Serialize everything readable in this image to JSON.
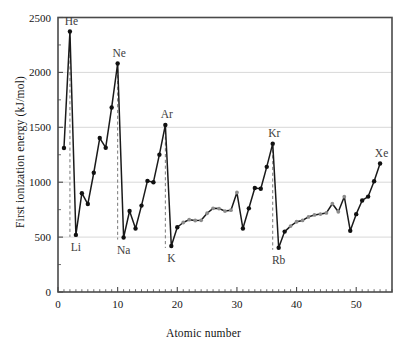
{
  "chart_data": {
    "type": "line",
    "title": "",
    "xlabel": "Atomic number",
    "ylabel": "First ionization energy (kJ/mol)",
    "xlim": [
      0,
      56
    ],
    "ylim": [
      0,
      2500
    ],
    "xticks": [
      0,
      10,
      20,
      30,
      40,
      50
    ],
    "yticks": [
      0,
      500,
      1000,
      1500,
      2000,
      2500
    ],
    "xticklabels": [
      "0",
      "10",
      "20",
      "30",
      "40",
      "50"
    ],
    "yticklabels": [
      "0",
      "500",
      "1000",
      "1500",
      "2000",
      "2500"
    ],
    "grid": "horizontal-major",
    "legend": "none",
    "x": [
      1,
      2,
      3,
      4,
      5,
      6,
      7,
      8,
      9,
      10,
      11,
      12,
      13,
      14,
      15,
      16,
      17,
      18,
      19,
      20,
      21,
      22,
      23,
      24,
      25,
      26,
      27,
      28,
      29,
      30,
      31,
      32,
      33,
      34,
      35,
      36,
      37,
      38,
      39,
      40,
      41,
      42,
      43,
      44,
      45,
      46,
      47,
      48,
      49,
      50,
      51,
      52,
      53,
      54
    ],
    "values": [
      1312,
      2372,
      520,
      900,
      801,
      1086,
      1402,
      1314,
      1681,
      2081,
      496,
      738,
      578,
      787,
      1012,
      1000,
      1251,
      1521,
      419,
      590,
      633,
      659,
      651,
      653,
      717,
      762,
      760,
      737,
      745,
      906,
      579,
      762,
      947,
      941,
      1140,
      1351,
      403,
      550,
      600,
      640,
      652,
      684,
      702,
      710,
      720,
      804,
      731,
      868,
      558,
      709,
      834,
      869,
      1008,
      1170
    ],
    "series": [
      {
        "name": "First ionization energy",
        "units": "kJ/mol",
        "points": [
          {
            "z": 1,
            "symbol": "H",
            "value": 1312,
            "marker": "filled"
          },
          {
            "z": 2,
            "symbol": "He",
            "value": 2372,
            "marker": "filled"
          },
          {
            "z": 3,
            "symbol": "Li",
            "value": 520,
            "marker": "filled"
          },
          {
            "z": 4,
            "symbol": "Be",
            "value": 900,
            "marker": "filled"
          },
          {
            "z": 5,
            "symbol": "B",
            "value": 801,
            "marker": "filled"
          },
          {
            "z": 6,
            "symbol": "C",
            "value": 1086,
            "marker": "filled"
          },
          {
            "z": 7,
            "symbol": "N",
            "value": 1402,
            "marker": "filled"
          },
          {
            "z": 8,
            "symbol": "O",
            "value": 1314,
            "marker": "filled"
          },
          {
            "z": 9,
            "symbol": "F",
            "value": 1681,
            "marker": "filled"
          },
          {
            "z": 10,
            "symbol": "Ne",
            "value": 2081,
            "marker": "filled"
          },
          {
            "z": 11,
            "symbol": "Na",
            "value": 496,
            "marker": "filled"
          },
          {
            "z": 12,
            "symbol": "Mg",
            "value": 738,
            "marker": "filled"
          },
          {
            "z": 13,
            "symbol": "Al",
            "value": 578,
            "marker": "filled"
          },
          {
            "z": 14,
            "symbol": "Si",
            "value": 787,
            "marker": "filled"
          },
          {
            "z": 15,
            "symbol": "P",
            "value": 1012,
            "marker": "filled"
          },
          {
            "z": 16,
            "symbol": "S",
            "value": 1000,
            "marker": "filled"
          },
          {
            "z": 17,
            "symbol": "Cl",
            "value": 1251,
            "marker": "filled"
          },
          {
            "z": 18,
            "symbol": "Ar",
            "value": 1521,
            "marker": "filled"
          },
          {
            "z": 19,
            "symbol": "K",
            "value": 419,
            "marker": "filled"
          },
          {
            "z": 20,
            "symbol": "Ca",
            "value": 590,
            "marker": "filled"
          },
          {
            "z": 21,
            "symbol": "Sc",
            "value": 633,
            "marker": "grey"
          },
          {
            "z": 22,
            "symbol": "Ti",
            "value": 659,
            "marker": "grey"
          },
          {
            "z": 23,
            "symbol": "V",
            "value": 651,
            "marker": "grey"
          },
          {
            "z": 24,
            "symbol": "Cr",
            "value": 653,
            "marker": "grey"
          },
          {
            "z": 25,
            "symbol": "Mn",
            "value": 717,
            "marker": "grey"
          },
          {
            "z": 26,
            "symbol": "Fe",
            "value": 762,
            "marker": "grey"
          },
          {
            "z": 27,
            "symbol": "Co",
            "value": 760,
            "marker": "grey"
          },
          {
            "z": 28,
            "symbol": "Ni",
            "value": 737,
            "marker": "grey"
          },
          {
            "z": 29,
            "symbol": "Cu",
            "value": 745,
            "marker": "grey"
          },
          {
            "z": 30,
            "symbol": "Zn",
            "value": 906,
            "marker": "grey"
          },
          {
            "z": 31,
            "symbol": "Ga",
            "value": 579,
            "marker": "filled"
          },
          {
            "z": 32,
            "symbol": "Ge",
            "value": 762,
            "marker": "filled"
          },
          {
            "z": 33,
            "symbol": "As",
            "value": 947,
            "marker": "filled"
          },
          {
            "z": 34,
            "symbol": "Se",
            "value": 941,
            "marker": "filled"
          },
          {
            "z": 35,
            "symbol": "Br",
            "value": 1140,
            "marker": "filled"
          },
          {
            "z": 36,
            "symbol": "Kr",
            "value": 1351,
            "marker": "filled"
          },
          {
            "z": 37,
            "symbol": "Rb",
            "value": 403,
            "marker": "filled"
          },
          {
            "z": 38,
            "symbol": "Sr",
            "value": 550,
            "marker": "filled"
          },
          {
            "z": 39,
            "symbol": "Y",
            "value": 600,
            "marker": "grey"
          },
          {
            "z": 40,
            "symbol": "Zr",
            "value": 640,
            "marker": "grey"
          },
          {
            "z": 41,
            "symbol": "Nb",
            "value": 652,
            "marker": "grey"
          },
          {
            "z": 42,
            "symbol": "Mo",
            "value": 684,
            "marker": "grey"
          },
          {
            "z": 43,
            "symbol": "Tc",
            "value": 702,
            "marker": "grey"
          },
          {
            "z": 44,
            "symbol": "Ru",
            "value": 710,
            "marker": "grey"
          },
          {
            "z": 45,
            "symbol": "Rh",
            "value": 720,
            "marker": "grey"
          },
          {
            "z": 46,
            "symbol": "Pd",
            "value": 804,
            "marker": "grey"
          },
          {
            "z": 47,
            "symbol": "Ag",
            "value": 731,
            "marker": "grey"
          },
          {
            "z": 48,
            "symbol": "Cd",
            "value": 868,
            "marker": "grey"
          },
          {
            "z": 49,
            "symbol": "In",
            "value": 558,
            "marker": "filled"
          },
          {
            "z": 50,
            "symbol": "Sn",
            "value": 709,
            "marker": "filled"
          },
          {
            "z": 51,
            "symbol": "Sb",
            "value": 834,
            "marker": "filled"
          },
          {
            "z": 52,
            "symbol": "Te",
            "value": 869,
            "marker": "filled"
          },
          {
            "z": 53,
            "symbol": "I",
            "value": 1008,
            "marker": "filled"
          },
          {
            "z": 54,
            "symbol": "Xe",
            "value": 1170,
            "marker": "filled"
          }
        ]
      }
    ],
    "annotations": [
      {
        "name": "He",
        "label": "He",
        "z": 2,
        "value": 2372,
        "position": "above"
      },
      {
        "name": "Ne",
        "label": "Ne",
        "z": 10,
        "value": 2081,
        "position": "above"
      },
      {
        "name": "Ar",
        "label": "Ar",
        "z": 18,
        "value": 1521,
        "position": "above"
      },
      {
        "name": "Kr",
        "label": "Kr",
        "z": 36,
        "value": 1351,
        "position": "above"
      },
      {
        "name": "Xe",
        "label": "Xe",
        "z": 54,
        "value": 1170,
        "position": "above"
      },
      {
        "name": "Li",
        "label": "Li",
        "z": 3,
        "value": 520,
        "position": "below"
      },
      {
        "name": "Na",
        "label": "Na",
        "z": 11,
        "value": 496,
        "position": "below"
      },
      {
        "name": "K",
        "label": "K",
        "z": 19,
        "value": 419,
        "position": "below"
      },
      {
        "name": "Rb",
        "label": "Rb",
        "z": 37,
        "value": 403,
        "position": "below"
      }
    ],
    "drop_lines": [
      {
        "name": "He-drop",
        "z": 2,
        "from": 2372,
        "to": 520
      },
      {
        "name": "Ne-drop",
        "z": 10,
        "from": 2081,
        "to": 496
      },
      {
        "name": "Ar-drop",
        "z": 18,
        "from": 1521,
        "to": 419
      },
      {
        "name": "Kr-drop",
        "z": 36,
        "from": 1351,
        "to": 403
      }
    ],
    "colors": {
      "line": "#1a1a1a",
      "marker_filled": "#111111",
      "marker_grey": "#8c8c8c",
      "grid": "#d8d8d8",
      "axis": "#4a4a4a",
      "text": "#141414",
      "annotation": "#3d3d3d",
      "background": "#ffffff"
    }
  }
}
